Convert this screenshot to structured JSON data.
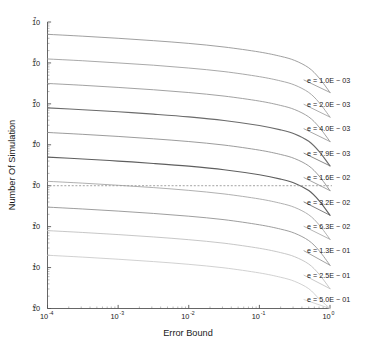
{
  "chart_data": {
    "type": "line",
    "title": "",
    "xlabel": "Error Bound",
    "ylabel": "Number Of Simulation",
    "xscale": "log",
    "yscale": "log",
    "xlim": [
      0.0001,
      1.0
    ],
    "ylim": [
      1,
      10000000
    ],
    "grid": false,
    "legend_position": "right-inline-labels",
    "x_ticks": [
      {
        "value": 0.0001,
        "base": "10",
        "exp": "-4"
      },
      {
        "value": 0.001,
        "base": "10",
        "exp": "-3"
      },
      {
        "value": 0.01,
        "base": "10",
        "exp": "-2"
      },
      {
        "value": 0.1,
        "base": "10",
        "exp": "-1"
      },
      {
        "value": 1.0,
        "base": "10",
        "exp": "0"
      }
    ],
    "y_ticks": [
      {
        "value": 1,
        "base": "10",
        "exp": "0"
      },
      {
        "value": 10,
        "base": "10",
        "exp": "1"
      },
      {
        "value": 100,
        "base": "10",
        "exp": "2"
      },
      {
        "value": 1000,
        "base": "10",
        "exp": "3"
      },
      {
        "value": 10000,
        "base": "10",
        "exp": "4"
      },
      {
        "value": 100000,
        "base": "10",
        "exp": "5"
      },
      {
        "value": 1000000,
        "base": "10",
        "exp": "6"
      },
      {
        "value": 10000000,
        "base": "10",
        "exp": "7"
      }
    ],
    "reference_line": {
      "orientation": "horizontal",
      "value": 1000,
      "style": "dashed",
      "color": "#9a9a9a"
    },
    "x": [
      0.0001,
      0.000316,
      0.001,
      0.00316,
      0.01,
      0.0316,
      0.1,
      0.2,
      0.316,
      0.5,
      0.7,
      1.0
    ],
    "series": [
      {
        "name": "e = 1.0E - 03",
        "label": "e = 1.0E − 03",
        "color": "#8f8f8f",
        "values": [
          5000000,
          4500000,
          4000000,
          3500000,
          3000000,
          2450000,
          1850000,
          1450000,
          1150000,
          760000,
          430000,
          190000
        ]
      },
      {
        "name": "e = 2.0E - 03",
        "label": "e = 2.0E − 03",
        "color": "#9a9a9a",
        "values": [
          1250000,
          1130000,
          1000000,
          880000,
          750000,
          615000,
          462000,
          363000,
          288000,
          190000,
          108000,
          47500
        ]
      },
      {
        "name": "e = 4.0E - 03",
        "label": "e = 4.0E − 03",
        "color": "#919191",
        "values": [
          315000,
          284000,
          252000,
          221000,
          189000,
          155000,
          117000,
          91500,
          72500,
          48000,
          27200,
          12000
        ]
      },
      {
        "name": "e = 7.9E - 03",
        "label": "e = 7.9E − 03",
        "color": "#6b6b6b",
        "values": [
          80000,
          72000,
          64000,
          56000,
          48000,
          39300,
          29600,
          23200,
          18400,
          12200,
          6900,
          3050
        ]
      },
      {
        "name": "e = 1.6E - 02",
        "label": "e = 1.6E − 02",
        "color": "#8a8a8a",
        "values": [
          20000,
          18000,
          16000,
          14000,
          12000,
          9840,
          7400,
          5800,
          4600,
          3050,
          1730,
          760
        ]
      },
      {
        "name": "e = 3.2E - 02",
        "label": "e = 3.2E − 02",
        "color": "#5f5f5f",
        "values": [
          5000,
          4500,
          4000,
          3500,
          3000,
          2460,
          1850,
          1450,
          1150,
          760,
          432,
          190
        ]
      },
      {
        "name": "e = 6.3E - 02",
        "label": "e = 6.3E − 02",
        "color": "#a2a2a2",
        "values": [
          1280,
          1155,
          1025,
          900,
          770,
          630,
          475,
          372,
          295,
          195,
          111,
          49
        ]
      },
      {
        "name": "e = 1.3E - 01",
        "label": "e = 1.3E − 01",
        "color": "#8d8d8d",
        "values": [
          300,
          270,
          240,
          210,
          180,
          148,
          111,
          87,
          69,
          45.6,
          26,
          11.4
        ]
      },
      {
        "name": "e = 2.5E - 01",
        "label": "e = 2.5E − 01",
        "color": "#bdbdbd",
        "values": [
          80,
          72,
          64,
          56,
          48,
          39.4,
          29.6,
          23.2,
          18.4,
          12.2,
          6.9,
          3.05
        ]
      },
      {
        "name": "e = 5.0E - 01",
        "label": "e = 5.0E − 01",
        "color": "#c9c9c9",
        "values": [
          20,
          18,
          16,
          14,
          12,
          9.85,
          7.4,
          5.8,
          4.6,
          3.05,
          1.73,
          1.0
        ]
      }
    ]
  },
  "colors": {
    "background": "#ffffff",
    "axis": "#555555",
    "text": "#1a1a1a",
    "reference_line": "#9a9a9a"
  }
}
